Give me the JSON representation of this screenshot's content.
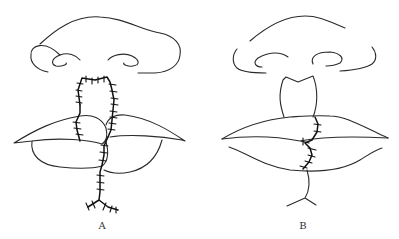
{
  "figure": {
    "panels": [
      {
        "id": "A",
        "label": "A",
        "description": "Sutured flap repair: nose outline, columellar/philtral flap with running sutures crossing upper and lower lips, Y-shaped sutured incision on chin"
      },
      {
        "id": "B",
        "label": "B",
        "description": "Result after repair: nose outline with separated columella, lips with short vertical sutured line through upper and lower lips, Y-shaped line on chin"
      }
    ],
    "colors": {
      "line": "#2a2a2a",
      "suture": "#111111",
      "background": "#ffffff"
    }
  }
}
